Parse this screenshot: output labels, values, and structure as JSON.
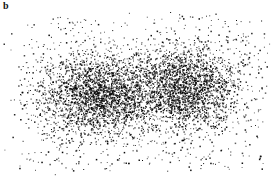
{
  "panel": {
    "label": "b"
  },
  "chart_data": {
    "type": "scatter",
    "title": "",
    "xlabel": "",
    "ylabel": "",
    "axes_visible": false,
    "grid": false,
    "legend": null,
    "point_color": "#000000",
    "background": "#ffffff",
    "xlim": [
      0,
      272
    ],
    "ylim": [
      0,
      179
    ],
    "series": [
      {
        "name": "cluster-1",
        "center": [
          98,
          95
        ],
        "sigma": [
          28,
          20
        ],
        "n": 2600
      },
      {
        "name": "cluster-2",
        "center": [
          185,
          88
        ],
        "sigma": [
          26,
          20
        ],
        "n": 2400
      },
      {
        "name": "background-noise",
        "range_x": [
          18,
          265
        ],
        "range_y": [
          15,
          170
        ],
        "n": 500
      }
    ]
  }
}
